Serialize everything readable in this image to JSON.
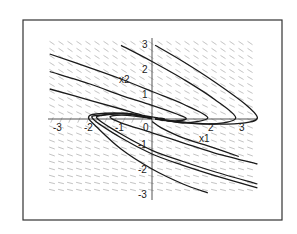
{
  "chart_data": {
    "type": "line",
    "title": "",
    "subtitle": "Phase portrait with direction field",
    "xlabel": "x1",
    "ylabel": "x2",
    "xlim": [
      -3.3,
      3.4
    ],
    "ylim": [
      -3.1,
      3.2
    ],
    "grid": false,
    "legend": null,
    "x_ticks": [
      {
        "value": -3,
        "label": "-3"
      },
      {
        "value": -2,
        "label": "-2"
      },
      {
        "value": -1,
        "label": "-1"
      },
      {
        "value": 0,
        "label": "0"
      },
      {
        "value": 2,
        "label": "2"
      },
      {
        "value": 3,
        "label": "3"
      }
    ],
    "y_ticks": [
      {
        "value": 3,
        "label": "3"
      },
      {
        "value": 2,
        "label": "2"
      },
      {
        "value": 1,
        "label": "1"
      },
      {
        "value": -1,
        "label": "-1"
      },
      {
        "value": -2,
        "label": "-2"
      },
      {
        "value": -3,
        "label": "-3"
      }
    ],
    "direction_field": {
      "shown": true,
      "style": "short dashes",
      "color": "#9a9a9a"
    },
    "trajectories": [
      {
        "name": "upper-1",
        "points": [
          [
            0.1,
            2.95
          ],
          [
            1.0,
            2.3
          ],
          [
            2.0,
            1.5
          ],
          [
            3.0,
            0.6
          ],
          [
            3.4,
            0.05
          ],
          [
            3.0,
            -0.15
          ],
          [
            2.0,
            -0.2
          ],
          [
            1.0,
            -0.12
          ],
          [
            0.2,
            0.0
          ]
        ]
      },
      {
        "name": "upper-2",
        "points": [
          [
            -1.0,
            2.95
          ],
          [
            0.0,
            2.3
          ],
          [
            1.0,
            1.6
          ],
          [
            2.0,
            0.8
          ],
          [
            2.7,
            0.05
          ],
          [
            2.0,
            -0.2
          ],
          [
            1.0,
            -0.15
          ],
          [
            0.2,
            0.0
          ]
        ]
      },
      {
        "name": "upper-3",
        "points": [
          [
            -3.3,
            2.6
          ],
          [
            -2.0,
            2.05
          ],
          [
            -1.0,
            1.6
          ],
          [
            0.0,
            1.1
          ],
          [
            1.0,
            0.6
          ],
          [
            1.8,
            0.05
          ],
          [
            1.0,
            -0.15
          ],
          [
            0.2,
            0.0
          ]
        ]
      },
      {
        "name": "upper-4",
        "points": [
          [
            -3.3,
            1.9
          ],
          [
            -2.0,
            1.4
          ],
          [
            -1.0,
            0.95
          ],
          [
            0.0,
            0.55
          ],
          [
            0.8,
            0.2
          ],
          [
            1.1,
            0.0
          ],
          [
            0.6,
            -0.08
          ],
          [
            0.1,
            0.0
          ]
        ]
      },
      {
        "name": "upper-5",
        "points": [
          [
            -3.3,
            1.2
          ],
          [
            -2.0,
            0.75
          ],
          [
            -1.0,
            0.4
          ],
          [
            -0.3,
            0.15
          ],
          [
            0.2,
            0.05
          ],
          [
            0.4,
            0.0
          ],
          [
            0.1,
            0.0
          ]
        ]
      },
      {
        "name": "lower-1",
        "points": [
          [
            3.4,
            -1.8
          ],
          [
            2.0,
            -1.35
          ],
          [
            1.0,
            -0.95
          ],
          [
            0.0,
            -0.55
          ],
          [
            -1.0,
            -0.15
          ],
          [
            -1.35,
            0.1
          ],
          [
            -0.8,
            0.15
          ],
          [
            0.0,
            0.02
          ]
        ]
      },
      {
        "name": "lower-2",
        "points": [
          [
            3.4,
            -2.6
          ],
          [
            2.0,
            -2.1
          ],
          [
            1.0,
            -1.7
          ],
          [
            0.0,
            -1.25
          ],
          [
            -1.0,
            -0.6
          ],
          [
            -1.75,
            0.0
          ],
          [
            -1.6,
            0.15
          ],
          [
            -0.8,
            0.2
          ],
          [
            0.0,
            0.02
          ]
        ]
      },
      {
        "name": "lower-3",
        "points": [
          [
            3.4,
            -2.75
          ],
          [
            2.0,
            -2.25
          ],
          [
            1.0,
            -1.85
          ],
          [
            0.0,
            -1.4
          ],
          [
            -1.0,
            -0.75
          ],
          [
            -1.9,
            0.0
          ],
          [
            -1.7,
            0.15
          ],
          [
            -0.8,
            0.22
          ],
          [
            0.0,
            0.02
          ]
        ]
      },
      {
        "name": "lower-4",
        "points": [
          [
            1.8,
            -2.95
          ],
          [
            1.0,
            -2.6
          ],
          [
            0.0,
            -2.0
          ],
          [
            -1.0,
            -1.2
          ],
          [
            -1.8,
            -0.3
          ],
          [
            -2.05,
            0.05
          ],
          [
            -1.8,
            0.2
          ],
          [
            -0.8,
            0.22
          ],
          [
            0.0,
            0.02
          ]
        ]
      },
      {
        "name": "lower-5",
        "points": [
          [
            2.8,
            -1.5
          ],
          [
            2.0,
            -1.15
          ],
          [
            1.0,
            -0.75
          ],
          [
            0.3,
            -0.35
          ],
          [
            0.0,
            -0.1
          ]
        ]
      }
    ]
  },
  "labels": {
    "x_axis": "x1",
    "y_axis": "x2"
  }
}
